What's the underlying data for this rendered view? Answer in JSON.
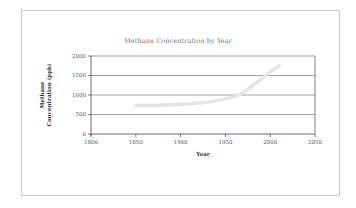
{
  "chart_data": {
    "type": "line",
    "title": "Methane Concentration by Year",
    "xlabel": "Year",
    "ylabel": "Methane Concentration (ppb)",
    "ylabel_lines": [
      "Methane",
      "Concentration (ppb)"
    ],
    "xlim": [
      1800,
      2050
    ],
    "ylim": [
      0,
      2000
    ],
    "x_ticks": [
      1800,
      1850,
      1900,
      1950,
      2000,
      2050
    ],
    "y_ticks": [
      0,
      500,
      1000,
      1500,
      2000
    ],
    "grid": true,
    "legend": null,
    "series": [
      {
        "name": "Methane Concentration",
        "color": "#e4e4e4",
        "x": [
          1850,
          1875,
          1900,
          1925,
          1950,
          1965,
          1975,
          1985,
          1995,
          2000,
          2010
        ],
        "values": [
          730,
          740,
          760,
          800,
          900,
          1000,
          1150,
          1320,
          1500,
          1600,
          1750
        ]
      }
    ]
  }
}
